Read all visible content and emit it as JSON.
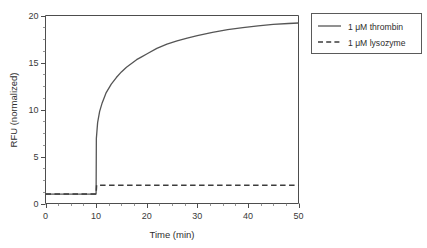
{
  "chart_data": {
    "type": "line",
    "title": "",
    "xlabel": "Time (min)",
    "ylabel": "RFU (normalized)",
    "xlim": [
      0,
      50
    ],
    "ylim": [
      0,
      20
    ],
    "xticks": [
      "0",
      "10",
      "20",
      "30",
      "40",
      "50"
    ],
    "yticks": [
      "0",
      "5",
      "10",
      "15",
      "20"
    ],
    "xtick_values": [
      0,
      10,
      20,
      30,
      40,
      50
    ],
    "ytick_values": [
      0,
      5,
      10,
      15,
      20
    ],
    "x_minor_step": 2.5,
    "y_minor_step": 1.25,
    "grid": false,
    "legend_position": "outside-top-right",
    "series": [
      {
        "name": "1 μM thrombin",
        "style": "solid",
        "color": "#555555",
        "x": [
          0,
          1,
          2,
          3,
          4,
          5,
          6,
          7,
          8,
          9,
          10,
          10.05,
          10.3,
          10.7,
          11.2,
          12,
          13,
          14,
          15,
          16,
          17,
          18,
          19,
          20,
          22,
          24,
          26,
          28,
          30,
          33,
          36,
          39,
          42,
          45,
          48,
          50
        ],
        "y": [
          1.0,
          1.0,
          1.0,
          1.0,
          1.0,
          1.0,
          1.0,
          1.0,
          1.0,
          1.0,
          1.0,
          6.9,
          8.6,
          9.8,
          10.7,
          11.8,
          12.7,
          13.4,
          14.0,
          14.5,
          14.9,
          15.3,
          15.6,
          15.9,
          16.5,
          16.95,
          17.3,
          17.6,
          17.85,
          18.2,
          18.5,
          18.7,
          18.9,
          19.05,
          19.15,
          19.2
        ]
      },
      {
        "name": "1 μM lysozyme",
        "style": "dashed",
        "color": "#3c3c3c",
        "x": [
          0,
          2,
          4,
          6,
          8,
          10,
          10.1,
          12,
          16,
          20,
          25,
          30,
          35,
          40,
          45,
          50
        ],
        "y": [
          1.0,
          1.0,
          1.0,
          1.0,
          1.0,
          1.0,
          1.95,
          1.95,
          1.95,
          1.95,
          1.95,
          1.95,
          1.95,
          1.95,
          1.95,
          1.95
        ]
      }
    ],
    "legend": [
      {
        "label": "1 μM thrombin",
        "style": "solid"
      },
      {
        "label": "1 μM lysozyme",
        "style": "dashed"
      }
    ]
  }
}
